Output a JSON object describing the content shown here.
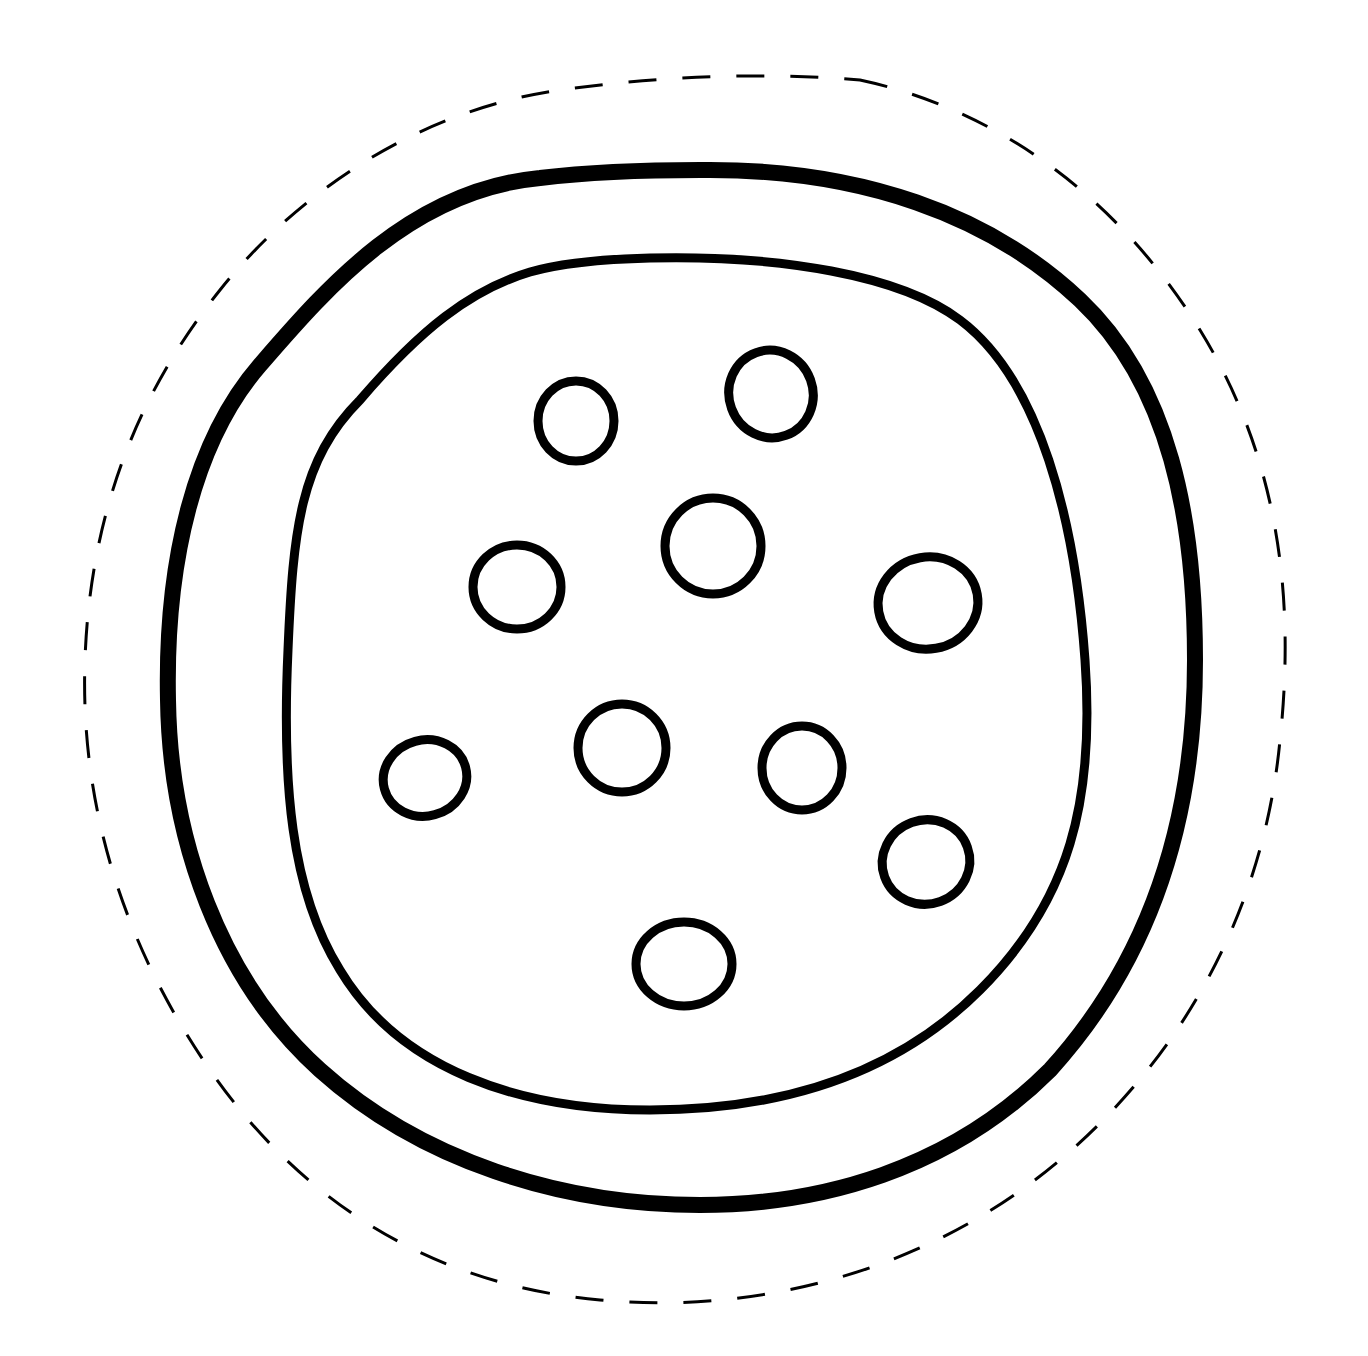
{
  "image": {
    "subject": "pizza coloring page cutout",
    "background_color": "#ffffff",
    "line_color": "#000000"
  },
  "shapes": {
    "cut_line": {
      "style": "dashed",
      "stroke_width": 3
    },
    "crust_outer": {
      "stroke_width": 16
    },
    "crust_inner": {
      "stroke_width": 9
    },
    "toppings_count": 10
  }
}
